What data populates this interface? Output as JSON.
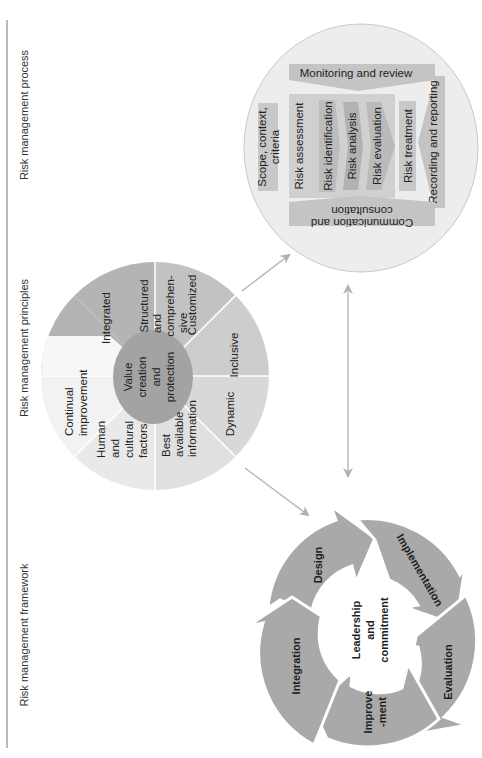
{
  "figure": {
    "orientation": "rotated 90 degrees (text reads bottom-to-top)",
    "headers": {
      "framework": "Risk management framework",
      "principles": "Risk management principles",
      "process": "Risk management process"
    },
    "principles": {
      "center": [
        "Value",
        "creation",
        "and",
        "protection"
      ],
      "segments": [
        {
          "lines": [
            "Integrated"
          ],
          "shade": "#b4b4b4"
        },
        {
          "lines": [
            "Structured",
            "and",
            "comprehen-",
            "sive"
          ],
          "shade": "#c3c3c3"
        },
        {
          "lines": [
            "Customized"
          ],
          "shade": "#cdcdcd"
        },
        {
          "lines": [
            "Inclusive"
          ],
          "shade": "#d7d7d7"
        },
        {
          "lines": [
            "Dynamic"
          ],
          "shade": "#e0e0e0"
        },
        {
          "lines": [
            "Best",
            "available",
            "information"
          ],
          "shade": "#e9e9e9"
        },
        {
          "lines": [
            "Human",
            "and",
            "cultural",
            "factors"
          ],
          "shade": "#f3f3f3"
        },
        {
          "lines": [
            "Continual",
            "improvement"
          ],
          "shade": "#f7f7f7"
        }
      ]
    },
    "process": {
      "monitoring": "Monitoring and review",
      "scope": [
        "Scope, context,",
        "criteria"
      ],
      "assessment": "Risk assessment",
      "identification": "Risk identification",
      "analysis": "Risk analysis",
      "evaluation": "Risk evaluation",
      "treatment": "Risk treatment",
      "recording": "Recording and reporting",
      "communication": [
        "Communication and",
        "consultation"
      ]
    },
    "framework": {
      "center": [
        "Leadership",
        "and",
        "commitment"
      ],
      "stages": [
        {
          "lines": [
            "Design"
          ]
        },
        {
          "lines": [
            "Implementation"
          ]
        },
        {
          "lines": [
            "Evaluation"
          ]
        },
        {
          "lines": [
            "Improve",
            "-ment"
          ]
        },
        {
          "lines": [
            "Integration"
          ]
        }
      ]
    },
    "colors": {
      "arrow": "#b0b0b0",
      "cycle": "#a9a9a9",
      "process_bg": "#ececec",
      "process_box": "#c8c8c8",
      "border": "#888888"
    }
  }
}
